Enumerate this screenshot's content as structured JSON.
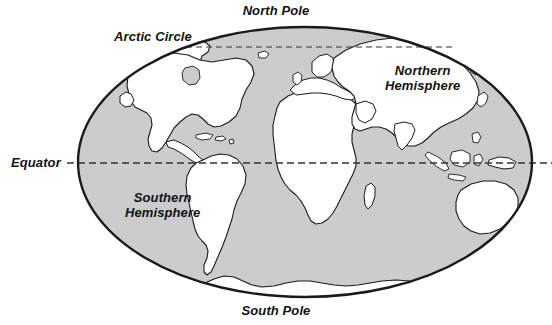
{
  "figure": {
    "type": "diagram"
  },
  "colors": {
    "ocean_fill": "#cccccc",
    "land_fill": "#ffffff",
    "outline": "#1a1a1a",
    "label_text": "#121212",
    "background": "#ffffff",
    "grid_line": "#333333"
  },
  "labels": {
    "north_pole": "North Pole",
    "south_pole": "South Pole",
    "arctic_circle": "Arctic Circle",
    "equator": "Equator",
    "northern_hemisphere_line1": "Northern",
    "northern_hemisphere_line2": "Hemisphere",
    "southern_hemisphere_line1": "Southern",
    "southern_hemisphere_line2": "Hemisphere"
  },
  "geometry": {
    "ellipse_center_x": 305,
    "ellipse_center_y": 162,
    "ellipse_radius_x": 228,
    "ellipse_radius_y": 135,
    "equator_y": 163,
    "equator_line_start_x": 67,
    "equator_line_end_x": 552,
    "arctic_circle_y": 47,
    "arctic_circle_start_x": 186,
    "arctic_circle_end_x": 450
  },
  "features": {
    "landmasses": [
      "North America",
      "Greenland",
      "South America",
      "Africa",
      "Madagascar",
      "Europe",
      "Asia",
      "Indonesia",
      "Australia",
      "New Zealand",
      "Antarctica",
      "Caribbean Islands",
      "Japan",
      "British Isles"
    ],
    "lines": [
      "Equator",
      "Arctic Circle"
    ]
  }
}
